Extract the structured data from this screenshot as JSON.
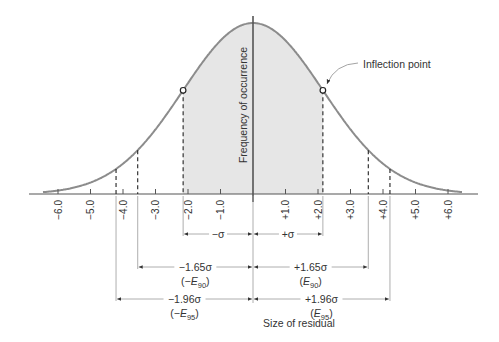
{
  "chart_data": {
    "type": "area",
    "title": "",
    "xlabel": "Size of residual",
    "ylabel": "Frequency of occurrence",
    "xlim": [
      -6.7,
      6.9
    ],
    "grid": false,
    "x_ticks": [
      -6.0,
      -5.0,
      -4.0,
      -3.0,
      -2.0,
      -1.0,
      1.0,
      2.0,
      3.0,
      4.0,
      5.0,
      6.0
    ],
    "x_tick_labels": [
      "−6.0",
      "−5.0",
      "−4.0",
      "−3.0",
      "−2.0",
      "−1.0",
      "+1.0",
      "+2.0",
      "+3.0",
      "+4.0",
      "+5.0",
      "+6.0"
    ],
    "curve": {
      "mean": 0,
      "sigma": 2.15,
      "shape": "gaussian"
    },
    "shaded_region": {
      "from_sigma": -1,
      "to_sigma": 1
    },
    "markers": [
      {
        "sigma": -1,
        "type": "open-circle"
      },
      {
        "sigma": 1,
        "type": "open-circle"
      }
    ],
    "dashed_lines_sigma": [
      -1.96,
      -1.65,
      -1,
      1,
      1.65,
      1.96
    ],
    "annotations": {
      "inflection_label": "Inflection point",
      "ranges": [
        {
          "left": "−σ",
          "right": "+σ",
          "sigma": 1
        },
        {
          "left": "−1.65σ",
          "left_sub": "(−E",
          "left_subscript": "90",
          "right": "+1.65σ",
          "right_sub": "(E",
          "right_subscript": "90",
          "sigma": 1.65
        },
        {
          "left": "−1.96σ",
          "left_sub": "(−E",
          "left_subscript": "95",
          "right": "+1.96σ",
          "right_sub": "(E",
          "right_subscript": "95",
          "sigma": 1.96
        }
      ]
    }
  },
  "colors": {
    "curve": "#8c8c8c",
    "fill": "#e6e6e6",
    "axis": "#555555",
    "text": "#333333"
  }
}
